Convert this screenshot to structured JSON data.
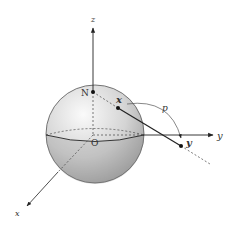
{
  "diagram": {
    "labels": {
      "z_axis": "z",
      "y_axis": "y",
      "x_axis": "x",
      "north_pole": "N",
      "origin": "O",
      "point_on_sphere": "x",
      "projected_point": "y",
      "map": "p"
    },
    "colors": {
      "sphere_light": "#f2f2f2",
      "sphere_dark": "#a0a0a0",
      "line": "#222222"
    }
  }
}
